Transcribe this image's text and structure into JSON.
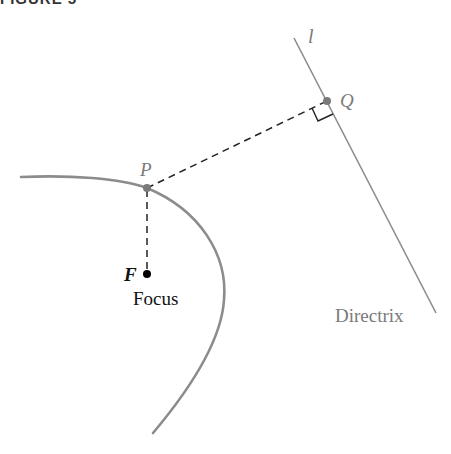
{
  "figure": {
    "title": "FIGURE 5"
  },
  "labels": {
    "line_name": "l",
    "point_q": "Q",
    "point_p": "P",
    "point_f": "F",
    "focus": "Focus",
    "directrix": "Directrix"
  },
  "colors": {
    "curve": "#8c8c8c",
    "directrix_line": "#8c8c8c",
    "dashed": "#222222",
    "point_gray": "#7a7a7a",
    "focus_point": "#000000",
    "label_gray": "#7a7a7a",
    "label_black": "#111111"
  }
}
